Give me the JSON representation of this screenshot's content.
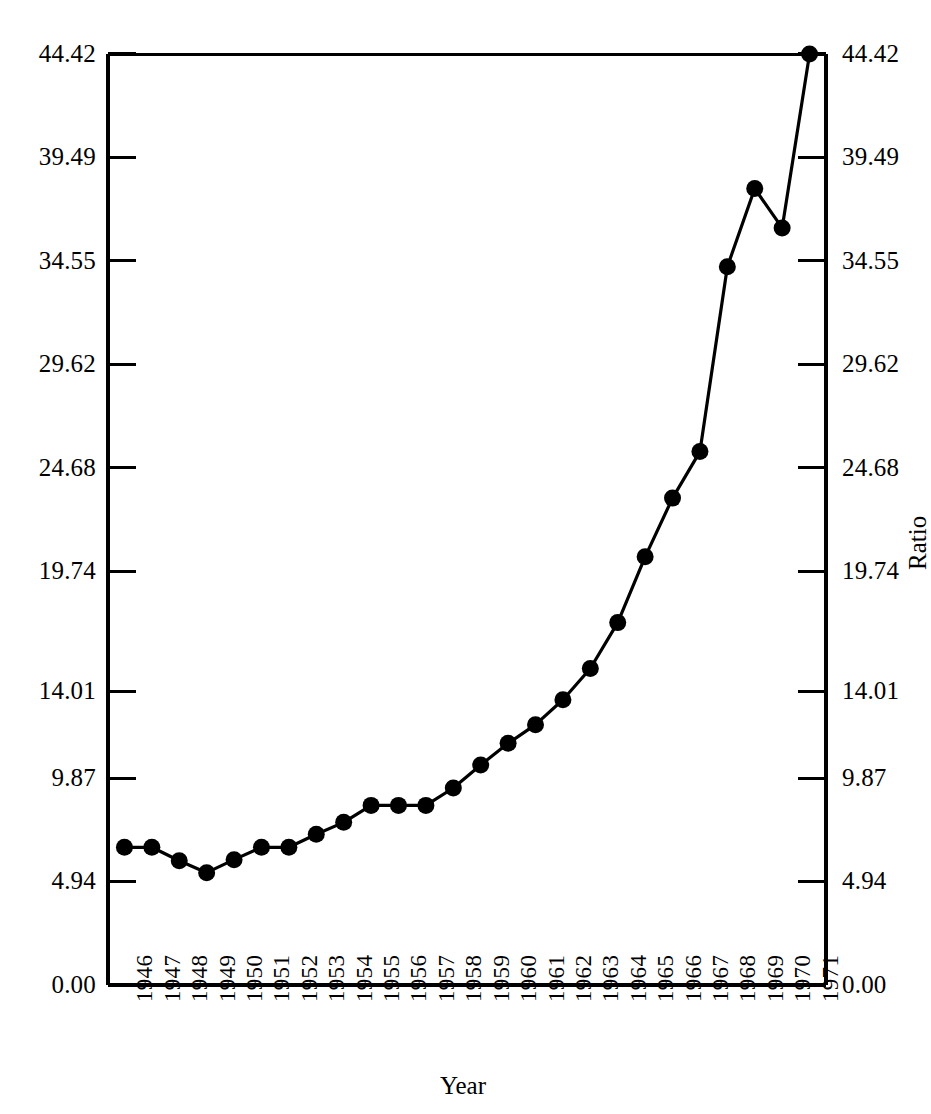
{
  "chart_data": {
    "type": "line",
    "title": "",
    "subtitle": "",
    "xlabel": "Year",
    "ylabel": "Ratio",
    "grid": false,
    "legend": null,
    "marker": "filled-circle",
    "line_color": "#000000",
    "marker_color": "#000000",
    "background_color": "#ffffff",
    "xlim": [
      1945.4,
      1971.6
    ],
    "ylim": [
      0.0,
      44.42
    ],
    "x_ticks": [
      1946,
      1947,
      1948,
      1949,
      1950,
      1951,
      1952,
      1953,
      1954,
      1955,
      1956,
      1957,
      1958,
      1959,
      1960,
      1961,
      1962,
      1963,
      1964,
      1965,
      1966,
      1967,
      1968,
      1969,
      1970,
      1971
    ],
    "x_tick_labels": [
      "1946",
      "1947",
      "1948",
      "1949",
      "1950",
      "1951",
      "1952",
      "1953",
      "1954",
      "1955",
      "1956",
      "1957",
      "1958",
      "1959",
      "1960",
      "1961",
      "1962",
      "1963",
      "1964",
      "1965",
      "1966",
      "1967",
      "1968",
      "1969",
      "1970",
      "1971"
    ],
    "y_ticks": [
      0.0,
      4.94,
      9.87,
      14.01,
      19.74,
      24.68,
      29.62,
      34.55,
      39.49,
      44.42
    ],
    "y_tick_labels": [
      "0.00",
      "4.94",
      "9.87",
      "14.01",
      "19.74",
      "24.68",
      "29.62",
      "34.55",
      "39.49",
      "44.42"
    ],
    "y_tick_labels_right": [
      "0.00",
      "4.94",
      "9.87",
      "14.01",
      "19.74",
      "24.68",
      "29.62",
      "34.55",
      "39.49",
      "44.42"
    ],
    "categories": [
      "1946",
      "1947",
      "1948",
      "1949",
      "1950",
      "1951",
      "1952",
      "1953",
      "1954",
      "1955",
      "1956",
      "1957",
      "1958",
      "1959",
      "1960",
      "1961",
      "1962",
      "1963",
      "1964",
      "1965",
      "1966",
      "1967",
      "1968",
      "1969",
      "1970",
      "1971"
    ],
    "x": [
      1946,
      1947,
      1948,
      1949,
      1950,
      1951,
      1952,
      1953,
      1954,
      1955,
      1956,
      1957,
      1958,
      1959,
      1960,
      1961,
      1962,
      1963,
      1964,
      1965,
      1966,
      1967,
      1968,
      1969,
      1970,
      1971
    ],
    "values": [
      6.57,
      6.57,
      5.93,
      5.36,
      5.98,
      6.57,
      6.57,
      7.19,
      7.76,
      8.57,
      8.57,
      8.57,
      9.4,
      10.5,
      11.53,
      12.42,
      13.61,
      15.1,
      17.29,
      20.43,
      23.23,
      25.45,
      34.27,
      38.0,
      36.12,
      44.42
    ],
    "series": [
      {
        "name": "Ratio",
        "values": [
          6.57,
          6.57,
          5.93,
          5.36,
          5.98,
          6.57,
          6.57,
          7.19,
          7.76,
          8.57,
          8.57,
          8.57,
          9.4,
          10.5,
          11.53,
          12.42,
          13.61,
          15.1,
          17.29,
          20.43,
          23.23,
          25.45,
          34.27,
          38.0,
          36.12,
          44.42
        ]
      }
    ]
  },
  "axes": {
    "x_title": "Year",
    "y_title": "Ratio"
  }
}
